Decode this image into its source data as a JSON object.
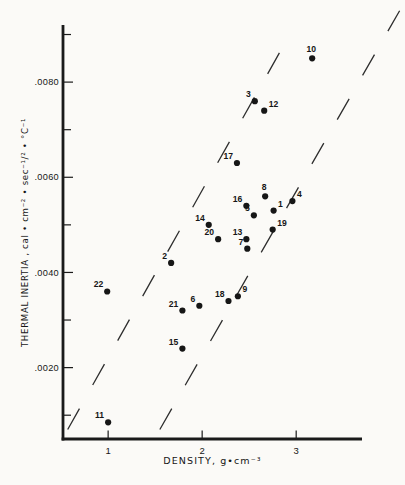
{
  "figure": {
    "background": "#fbfaf7",
    "ink": "#1a1a1a"
  },
  "chart_data": {
    "type": "scatter",
    "title": "",
    "xlabel": "DENSITY, g•cm⁻³",
    "ylabel": "THERMAL INERTIA , cal • cm⁻² • sec⁻¹/² • °C⁻¹",
    "xlim": [
      0.52,
      3.7
    ],
    "ylim": [
      0.0005,
      0.0092
    ],
    "grid": false,
    "legend": "none",
    "x_ticks": [
      {
        "value": 1,
        "label": "1"
      },
      {
        "value": 2,
        "label": "2"
      },
      {
        "value": 3,
        "label": "3"
      }
    ],
    "y_ticks_major": [
      {
        "value": 0.008,
        "label": ".0080"
      },
      {
        "value": 0.006,
        "label": ".0060"
      },
      {
        "value": 0.004,
        "label": ".0040"
      },
      {
        "value": 0.002,
        "label": ".0020"
      }
    ],
    "y_ticks_minor": [
      0.009,
      0.007,
      0.005,
      0.003,
      0.001
    ],
    "points": [
      {
        "id": "1",
        "x": 2.76,
        "y": 0.0053,
        "label_side": "right"
      },
      {
        "id": "2",
        "x": 1.67,
        "y": 0.0042,
        "label_side": "left"
      },
      {
        "id": "3",
        "x": 2.56,
        "y": 0.0076,
        "label_side": "left"
      },
      {
        "id": "4",
        "x": 2.96,
        "y": 0.0055,
        "label_side": "right"
      },
      {
        "id": "5",
        "x": 2.55,
        "y": 0.0052,
        "label_side": "left"
      },
      {
        "id": "6",
        "x": 1.97,
        "y": 0.0033,
        "label_side": "left"
      },
      {
        "id": "7",
        "x": 2.48,
        "y": 0.0045,
        "label_side": "left"
      },
      {
        "id": "8",
        "x": 2.67,
        "y": 0.0056,
        "label_side": "above"
      },
      {
        "id": "9",
        "x": 2.38,
        "y": 0.0035,
        "label_side": "right"
      },
      {
        "id": "10",
        "x": 3.17,
        "y": 0.0085,
        "label_side": "above"
      },
      {
        "id": "11",
        "x": 1.0,
        "y": 0.00085,
        "label_side": "left"
      },
      {
        "id": "12",
        "x": 2.66,
        "y": 0.0074,
        "label_side": "right"
      },
      {
        "id": "13",
        "x": 2.47,
        "y": 0.0047,
        "label_side": "left"
      },
      {
        "id": "14",
        "x": 2.07,
        "y": 0.005,
        "label_side": "left"
      },
      {
        "id": "15",
        "x": 1.79,
        "y": 0.0024,
        "label_side": "left"
      },
      {
        "id": "16",
        "x": 2.47,
        "y": 0.0054,
        "label_side": "left"
      },
      {
        "id": "17",
        "x": 2.37,
        "y": 0.0063,
        "label_side": "left"
      },
      {
        "id": "18",
        "x": 2.28,
        "y": 0.0034,
        "label_side": "left"
      },
      {
        "id": "19",
        "x": 2.75,
        "y": 0.0049,
        "label_side": "right"
      },
      {
        "id": "20",
        "x": 2.17,
        "y": 0.0047,
        "label_side": "left"
      },
      {
        "id": "21",
        "x": 1.79,
        "y": 0.0032,
        "label_side": "left"
      },
      {
        "id": "22",
        "x": 0.99,
        "y": 0.0036,
        "label_side": "left"
      }
    ],
    "dashed_lines": [
      {
        "x1": 0.57,
        "y1": 0.0007,
        "x2": 2.96,
        "y2": 0.0091
      },
      {
        "x1": 1.55,
        "y1": 0.0007,
        "x2": 4.1,
        "y2": 0.0095
      }
    ],
    "marker_color": "#161616",
    "line_color": "#2e2e2e"
  }
}
